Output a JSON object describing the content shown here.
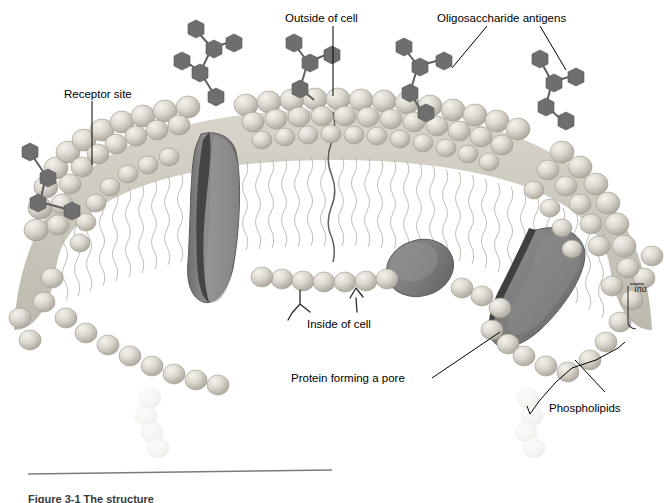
{
  "figure": {
    "type": "cell-membrane-cross-section",
    "title_visible": false,
    "caption": "Figure 3-1  The structure",
    "caption_clipped": true
  },
  "labels": {
    "receptor_site": "Receptor site",
    "outside_of_cell": "Outside of cell",
    "oligosaccharide_antigens": "Oligosaccharide antigens",
    "inside_of_cell": "Inside of cell",
    "protein_forming_a_pore": "Protein forming a pore",
    "phospholipids": "Phospholipids",
    "handwritten_annotation": "ina"
  },
  "colors": {
    "background": "#ffffff",
    "lipid_head_light": "#e6e3dc",
    "lipid_head_mid": "#cecabf",
    "lipid_head_shadow": "#a9a59a",
    "lipid_tail": "#c9c5ba",
    "protein_body": "#8a8a8a",
    "protein_cleft": "#4a4a4a",
    "protein_edge": "#6e6e6e",
    "sugar_unit": "#6e6e6e",
    "leader_line": "#000000",
    "caption_rule": "#7a7a7a",
    "text": "#000000"
  },
  "structures": {
    "bilayer": "curved arch, two leaflets of phospholipid heads with wavy hydrocarbon tails between",
    "transmembrane_proteins": 3,
    "pore_proteins_labeled": 1,
    "oligosaccharide_chains": 5,
    "cytoplasmic_y_structures": 2,
    "faded_trailing_lipids": 2
  }
}
